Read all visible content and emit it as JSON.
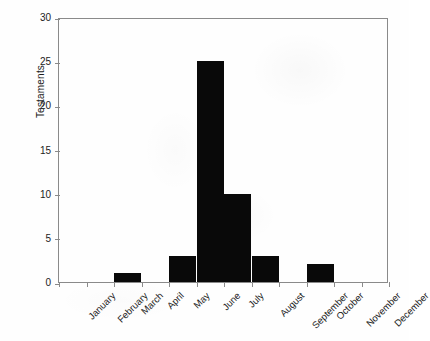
{
  "chart_data": {
    "type": "bar",
    "title": "",
    "subtitle": "",
    "xlabel": "",
    "ylabel": "Testaments",
    "categories": [
      "January",
      "February",
      "March",
      "April",
      "May",
      "June",
      "July",
      "August",
      "September",
      "October",
      "November",
      "December"
    ],
    "values": [
      0,
      0,
      1,
      0,
      3,
      25,
      10,
      3,
      0,
      2,
      0,
      0
    ],
    "ylim": [
      0,
      30
    ],
    "yticks": [
      0,
      5,
      10,
      15,
      20,
      25,
      30
    ],
    "ytick_labels": [
      "0",
      "5",
      "10",
      "15",
      "20",
      "25",
      "30"
    ],
    "grid": false,
    "legend": null,
    "legend_position": "none",
    "bar_color": "#090909",
    "axis_color": "#8a8a8a",
    "text_color": "#1c1c1c",
    "background_color": "#ffffff"
  }
}
